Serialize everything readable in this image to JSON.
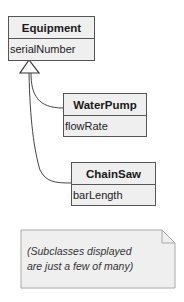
{
  "diagram": {
    "type": "UML class diagram",
    "classes": [
      {
        "name": "Equipment",
        "attributes": [
          "serialNumber"
        ]
      },
      {
        "name": "WaterPump",
        "attributes": [
          "flowRate"
        ]
      },
      {
        "name": "ChainSaw",
        "attributes": [
          "barLength"
        ]
      }
    ],
    "relations": [
      {
        "from": "WaterPump",
        "to": "Equipment",
        "kind": "generalization"
      },
      {
        "from": "ChainSaw",
        "to": "Equipment",
        "kind": "generalization"
      }
    ],
    "note": {
      "line1": "(Subclasses displayed",
      "line2": "are just a few of many)"
    }
  },
  "colors": {
    "box_fill": "#efefef",
    "box_border": "#555555",
    "note_fill": "#efefef"
  }
}
